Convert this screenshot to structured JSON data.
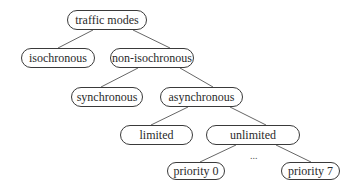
{
  "diagram": {
    "type": "tree",
    "nodes": {
      "root": {
        "label": "traffic modes"
      },
      "iso": {
        "label": "isochronous"
      },
      "noniso": {
        "label": "non-isochronous"
      },
      "sync": {
        "label": "synchronous"
      },
      "async": {
        "label": "asynchronous"
      },
      "limited": {
        "label": "limited"
      },
      "unlimited": {
        "label": "unlimited"
      },
      "p0": {
        "label": "priority 0"
      },
      "p7": {
        "label": "priority 7"
      }
    },
    "ellipsis": "...",
    "edges": [
      [
        "traffic modes",
        "isochronous"
      ],
      [
        "traffic modes",
        "non-isochronous"
      ],
      [
        "non-isochronous",
        "synchronous"
      ],
      [
        "non-isochronous",
        "asynchronous"
      ],
      [
        "asynchronous",
        "limited"
      ],
      [
        "asynchronous",
        "unlimited"
      ],
      [
        "unlimited",
        "priority 0"
      ],
      [
        "unlimited",
        "priority 7"
      ]
    ]
  }
}
